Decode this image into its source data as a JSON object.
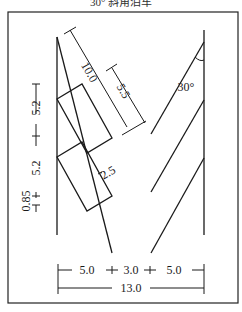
{
  "caption": "30° 斜角泊车",
  "diagram": {
    "angle_label": "30°",
    "dimensions": {
      "stall_depth_diagonal": "10.0",
      "stall_partial": "5.5",
      "stall_width": "2.5",
      "vertical_spacing_upper": "5.2",
      "vertical_spacing_lower": "5.2",
      "offset": "0.85",
      "bottom_left": "5.0",
      "bottom_middle": "3.0",
      "bottom_right": "5.0",
      "total_width": "13.0"
    }
  },
  "colors": {
    "line": "#1a1a1a",
    "background": "#ffffff"
  }
}
